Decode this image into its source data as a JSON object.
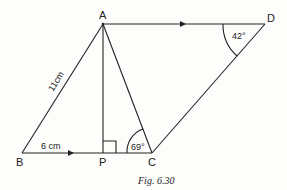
{
  "figure": {
    "caption": "Fig. 6.30",
    "points": {
      "A": {
        "label": "A",
        "x": 103,
        "y": 24
      },
      "D": {
        "label": "D",
        "x": 265,
        "y": 24
      },
      "B": {
        "label": "B",
        "x": 22,
        "y": 153
      },
      "P": {
        "label": "P",
        "x": 103,
        "y": 153
      },
      "C": {
        "label": "C",
        "x": 152,
        "y": 153
      }
    },
    "measurements": {
      "AB": "11cm",
      "BP": "6 cm",
      "angle_C": "69°",
      "angle_D": "42°"
    },
    "colors": {
      "line": "#222222",
      "background": "#fdfdfb"
    }
  }
}
